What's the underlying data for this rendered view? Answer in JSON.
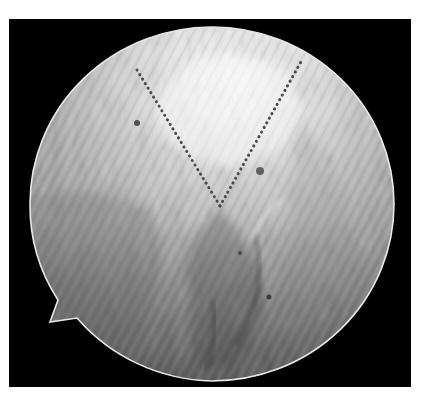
{
  "image": {
    "description": "Grayscale arthroscopic view inside a circular field with a dotted V-shaped annotation",
    "palette": {
      "background": "#ffffff",
      "frame": "#000000",
      "rim": "#e8e8e8",
      "tissue_light": "#f4f4f4",
      "tissue_mid": "#b5b5b5",
      "tissue_dark": "#6a6a6a",
      "annotation": "#4a4a4a"
    },
    "annotation": {
      "type": "dotted-v",
      "label": ""
    }
  }
}
